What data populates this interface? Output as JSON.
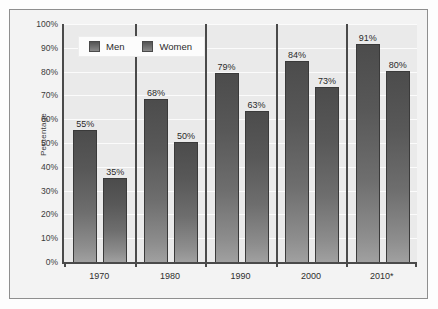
{
  "chart_data": {
    "type": "bar",
    "title": "",
    "xlabel": "",
    "ylabel": "Percentage",
    "categories": [
      "1970",
      "1980",
      "1990",
      "2000",
      "2010*"
    ],
    "series": [
      {
        "name": "Men",
        "values": [
          55,
          68,
          79,
          84,
          91
        ],
        "labels": [
          "55%",
          "68%",
          "79%",
          "84%",
          "91%"
        ],
        "color": "#5a5a5a"
      },
      {
        "name": "Women",
        "values": [
          35,
          50,
          63,
          73,
          80
        ],
        "labels": [
          "35%",
          "50%",
          "63%",
          "73%",
          "80%"
        ],
        "color": "#5a5a5a"
      }
    ],
    "ylim": [
      0,
      100
    ],
    "ytick_values": [
      0,
      10,
      20,
      30,
      40,
      50,
      60,
      70,
      80,
      90,
      100
    ],
    "ytick_labels": [
      "0%",
      "10%",
      "20%",
      "30%",
      "40%",
      "50%",
      "60%",
      "70%",
      "80%",
      "90%",
      "100%"
    ],
    "grid": "horizontal",
    "legend_position": "top-left",
    "plot_background": "#eaeaea",
    "gridline_color": "#fbfbfb",
    "axis_color": "#4a4a4a",
    "frame_color": "#8e8e8e"
  },
  "legend": {
    "items": [
      {
        "label": "Men"
      },
      {
        "label": "Women"
      }
    ]
  }
}
